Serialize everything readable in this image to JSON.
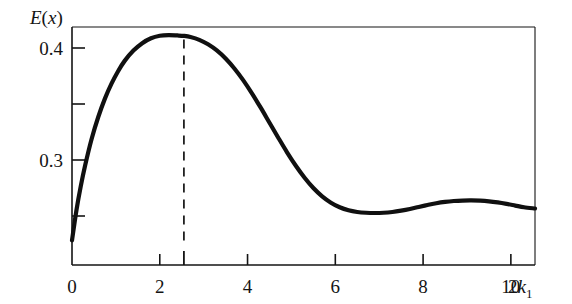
{
  "figure": {
    "background_color": "#ffffff",
    "ink_color": "#141414",
    "curve_color": "#101010",
    "curve_width_px": 4.2,
    "frame_width_px": 1.3
  },
  "chart_data": {
    "type": "line",
    "title": "",
    "subtitle": "",
    "ylabel": "E(x)",
    "ylabel_parts": {
      "symbol": "E",
      "open_paren": "(",
      "variable": "x",
      "close_paren": ")"
    },
    "xlabel": "2k₁",
    "xlabel_parts": {
      "coefficient": "2",
      "symbol": "k",
      "subscript": "1"
    },
    "xlim": [
      0,
      10.55
    ],
    "ylim": [
      0.2282,
      0.4169
    ],
    "grid": false,
    "legend": null,
    "xticks": [
      0,
      2,
      4,
      6,
      8,
      10
    ],
    "xtick_labels": [
      "0",
      "2",
      "4",
      "6",
      "8",
      "10"
    ],
    "x_minor_ticks": [
      2.55
    ],
    "yticks": [
      0.3,
      0.4
    ],
    "ytick_labels": [
      "0.3",
      "0.4"
    ],
    "y_minor_ticks": [
      0.25,
      0.35
    ],
    "annotations": [
      {
        "kind": "vertical-dashed-line",
        "x": 2.55,
        "y_from": 0.2282,
        "y_to": 0.4112,
        "label": ""
      }
    ],
    "features": {
      "global_maximum": {
        "x": 2.55,
        "y": 0.411
      },
      "local_minimum": {
        "x": 7.1,
        "y": 0.2556
      },
      "secondary_maximum": {
        "x": 9.3,
        "y": 0.2632
      },
      "start_point": {
        "x": 0.0,
        "y": 0.2282
      },
      "end_point": {
        "x": 10.55,
        "y": 0.2567
      }
    },
    "x": [
      0.0,
      0.1,
      0.2,
      0.3,
      0.45,
      0.6,
      0.75,
      0.9,
      1.05,
      1.2,
      1.4,
      1.6,
      1.8,
      2.0,
      2.2,
      2.4,
      2.55,
      2.7,
      2.9,
      3.1,
      3.3,
      3.5,
      3.7,
      3.9,
      4.1,
      4.3,
      4.5,
      4.7,
      4.9,
      5.1,
      5.3,
      5.5,
      5.7,
      5.9,
      6.1,
      6.3,
      6.5,
      6.7,
      6.9,
      7.1,
      7.3,
      7.5,
      7.7,
      7.9,
      8.1,
      8.3,
      8.5,
      8.7,
      8.9,
      9.1,
      9.3,
      9.5,
      9.7,
      9.9,
      10.1,
      10.3,
      10.55
    ],
    "y": [
      0.2282,
      0.2548,
      0.2766,
      0.2953,
      0.3192,
      0.3386,
      0.3548,
      0.3682,
      0.3793,
      0.3885,
      0.3977,
      0.4043,
      0.4087,
      0.4109,
      0.4115,
      0.4112,
      0.4108,
      0.4098,
      0.4073,
      0.4033,
      0.3978,
      0.3906,
      0.3817,
      0.3713,
      0.3595,
      0.3467,
      0.3333,
      0.3199,
      0.3069,
      0.2949,
      0.2842,
      0.275,
      0.2676,
      0.2619,
      0.2578,
      0.2551,
      0.2536,
      0.2529,
      0.2527,
      0.2529,
      0.2536,
      0.2548,
      0.2563,
      0.2581,
      0.2598,
      0.2614,
      0.2626,
      0.2634,
      0.2638,
      0.2639,
      0.2637,
      0.2631,
      0.2621,
      0.2608,
      0.2593,
      0.2578,
      0.2567
    ]
  }
}
